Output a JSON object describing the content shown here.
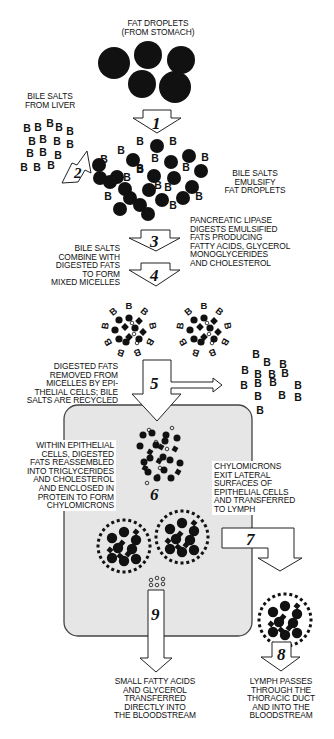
{
  "colors": {
    "ink": "#111111",
    "cell_fill": "#e6e6e6",
    "cell_border": "#444444",
    "background": "#ffffff"
  },
  "labels": {
    "fat_droplets": "FAT DROPLETS\n(FROM STOMACH)",
    "bile_salts_from_liver": "BILE SALTS\nFROM LIVER",
    "bile_salts_emulsify": "BILE SALTS\nEMULSIFY\nFAT DROPLETS",
    "pancreatic_lipase": "PANCREATIC LIPASE\nDIGESTS EMULSIFIED\nFATS PRODUCING\nFATTY ACIDS, GLYCEROL\nMONOGLYCERIDES\nAND CHOLESTEROL",
    "mixed_micelles": "BILE SALTS\nCOMBINE WITH\nDIGESTED FATS\nTO FORM\nMIXED MICELLES",
    "digested_fats_removed": "DIGESTED FATS\nREMOVED FROM\nMICELLES BY EPI-\nTHELIAL CELLS; BILE\nSALTS ARE RECYCLED",
    "within_epithelial": "WITHIN EPITHELIAL\nCELLS, DIGESTED\nFATS REASSEMBLED\nINTO TRIGLYCERIDES\nAND CHOLESTEROL\nAND ENCLOSED IN\nPROTEIN TO FORM\nCHYLOMICRONS",
    "chylomicrons_exit": "CHYLOMICRONS\nEXIT LATERAL\nSURFACES OF\nEPITHELIAL CELLS\nAND TRANSFERRED\nTO LYMPH",
    "small_fatty_acids": "SMALL FATTY ACIDS\nAND GLYCEROL\nTRANSFERRED\nDIRECTLY INTO\nTHE BLOODSTREAM",
    "lymph_passes": "LYMPH PASSES\nTHROUGH THE\nTHORACIC DUCT\nAND INTO THE\nBLOODSTREAM"
  },
  "steps": [
    "1",
    "2",
    "3",
    "4",
    "5",
    "6",
    "7",
    "8",
    "9"
  ],
  "bile_salt_symbol": "B",
  "icons": {
    "fat_droplet": "filled-circle",
    "bile_salt": "letter-B",
    "micelle": "circle-cluster",
    "chylomicron": "dotted-ring-cluster",
    "epithelial_cell": "rounded-rectangle",
    "step_arrow": "hollow-block-arrow"
  }
}
